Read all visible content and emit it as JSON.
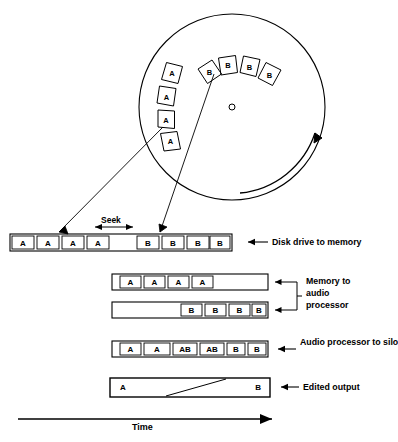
{
  "diagram": {
    "title_visible": false,
    "axis": {
      "label": "Time",
      "direction": "left-to-right"
    },
    "seek_label": "Seek"
  },
  "disk": {
    "name": "rotating-disk-platter",
    "center": {
      "cx": 232,
      "cy": 107
    },
    "radius": 93,
    "hub_radius": 3,
    "rotation_arrow": "counter-clockwise-sweep-arrow",
    "sectors": [
      {
        "label": "A",
        "angle_deg": 196,
        "id": "sector-a-1"
      },
      {
        "label": "A",
        "angle_deg": 212,
        "id": "sector-a-2"
      },
      {
        "label": "A",
        "angle_deg": 228,
        "id": "sector-a-3"
      },
      {
        "label": "A",
        "angle_deg": 244,
        "id": "sector-a-4"
      },
      {
        "label": "B",
        "angle_deg": 283,
        "id": "sector-b-1"
      },
      {
        "label": "B",
        "angle_deg": 267,
        "id": "sector-b-2"
      },
      {
        "label": "B",
        "angle_deg": 299,
        "id": "sector-b-3"
      },
      {
        "label": "B",
        "angle_deg": 315,
        "id": "sector-b-4"
      }
    ]
  },
  "tracks": [
    {
      "id": "track-disk-to-memory",
      "label": "Disk drive to memory",
      "label_arrow": "left-arrow",
      "x0": 10,
      "x1": 232,
      "y": 234,
      "h": 17,
      "blocks": [
        {
          "label": "A",
          "x": 12,
          "w": 22
        },
        {
          "label": "A",
          "x": 37,
          "w": 22
        },
        {
          "label": "A",
          "x": 62,
          "w": 22
        },
        {
          "label": "A",
          "x": 87,
          "w": 22
        },
        {
          "label": "B",
          "x": 137,
          "w": 22
        },
        {
          "label": "B",
          "x": 162,
          "w": 22
        },
        {
          "label": "B",
          "x": 187,
          "w": 22
        },
        {
          "label": "B",
          "x": 210,
          "w": 20
        }
      ]
    },
    {
      "id": "track-memory-to-audio-a",
      "label": "Memory to audio processor",
      "label_arrow": "left-arrow",
      "x0": 112,
      "x1": 268,
      "y": 274,
      "h": 16,
      "blocks": [
        {
          "label": "A",
          "x": 120,
          "w": 21
        },
        {
          "label": "A",
          "x": 144,
          "w": 21
        },
        {
          "label": "A",
          "x": 168,
          "w": 21
        },
        {
          "label": "A",
          "x": 192,
          "w": 21
        }
      ]
    },
    {
      "id": "track-memory-to-audio-b",
      "label": "",
      "label_arrow": "left-arrow",
      "x0": 112,
      "x1": 268,
      "y": 302,
      "h": 16,
      "blocks": [
        {
          "label": "B",
          "x": 181,
          "w": 21
        },
        {
          "label": "B",
          "x": 205,
          "w": 21
        },
        {
          "label": "B",
          "x": 229,
          "w": 21
        },
        {
          "label": "B",
          "x": 252,
          "w": 21
        }
      ]
    },
    {
      "id": "track-audio-to-silo",
      "label": "Audio processor to silo",
      "label_arrow": "left-arrow",
      "x0": 112,
      "x1": 268,
      "y": 341,
      "h": 16,
      "blocks": [
        {
          "label": "A",
          "x": 120,
          "w": 21
        },
        {
          "label": "A",
          "x": 144,
          "w": 26
        },
        {
          "label": "AB",
          "x": 173,
          "w": 24
        },
        {
          "label": "AB",
          "x": 200,
          "w": 24
        },
        {
          "label": "B",
          "x": 227,
          "w": 18
        },
        {
          "label": "B",
          "x": 248,
          "w": 18
        }
      ]
    },
    {
      "id": "track-edited-output",
      "label": "Edited output",
      "label_arrow": "left-arrow",
      "x0": 110,
      "x1": 270,
      "y": 378,
      "h": 19,
      "crossfade": {
        "from": "A",
        "to": "B",
        "x_start": 166,
        "x_end": 226
      },
      "blocks": [
        {
          "label": "A",
          "x": 110,
          "w": 160,
          "align": "left"
        },
        {
          "label": "B",
          "x": 110,
          "w": 160,
          "align": "right"
        }
      ]
    }
  ],
  "bracket": {
    "id": "memory-to-audio-bracket",
    "label_lines": [
      "Memory to",
      "audio",
      "processor"
    ]
  },
  "leaders": [
    {
      "id": "leader-a-sectors",
      "from": {
        "x": 163,
        "y": 128
      },
      "to": {
        "x": 60,
        "y": 231
      }
    },
    {
      "id": "leader-b-sectors",
      "from": {
        "x": 215,
        "y": 75
      },
      "to": {
        "x": 160,
        "y": 231
      }
    }
  ],
  "colors": {
    "ink": "#000000",
    "paper": "#ffffff"
  }
}
